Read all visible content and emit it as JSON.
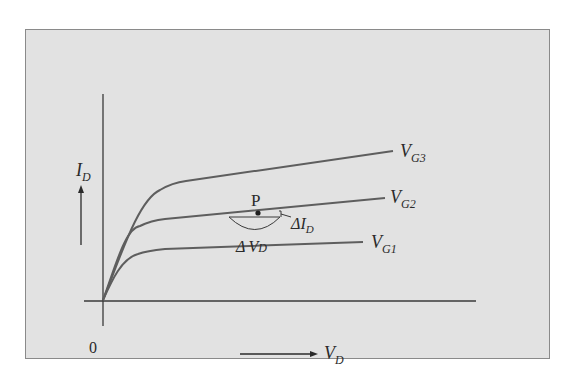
{
  "figure": {
    "type": "MOSFET drain characteristic curves",
    "background_color": "#e2e2e2",
    "line_color": "#5a5a5a",
    "axes": {
      "origin_label": "0",
      "y_label": {
        "main": "I",
        "sub": "D"
      },
      "x_label": {
        "main": "V",
        "sub": "D"
      }
    },
    "curves": [
      {
        "id": "vg3",
        "label": {
          "main": "V",
          "sub": "G3"
        }
      },
      {
        "id": "vg2",
        "label": {
          "main": "V",
          "sub": "G2"
        }
      },
      {
        "id": "vg1",
        "label": {
          "main": "V",
          "sub": "G1"
        }
      }
    ],
    "annotations": {
      "point": "P",
      "delta_id": {
        "delta": "Δ",
        "main": "I",
        "sub": "D"
      },
      "delta_vd": {
        "delta": "Δ",
        "main": "V",
        "sub": "D"
      }
    }
  }
}
